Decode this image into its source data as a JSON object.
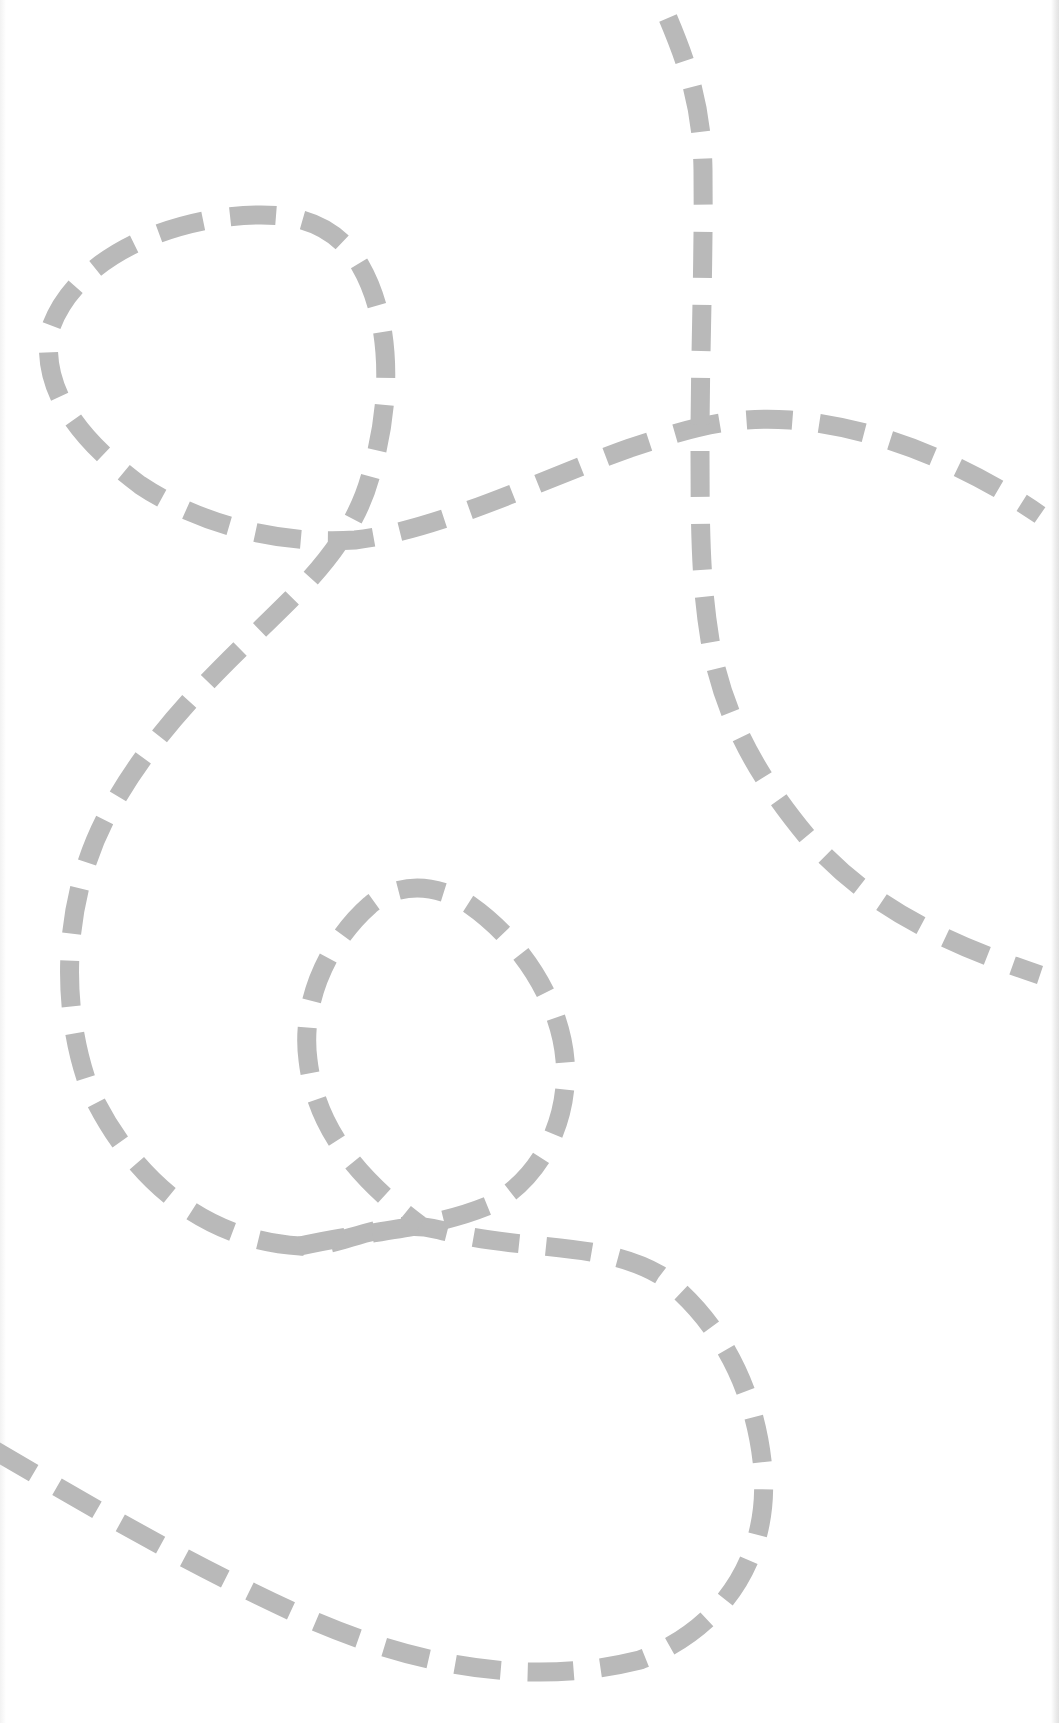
{
  "worksheet": {
    "title": "",
    "description": "Dashed-line tracing / cutting practice sheet",
    "background_color": "#ffffff",
    "line_color": "#b9b9b9",
    "line_width": 19,
    "dash_length": 46,
    "gap_length": 27
  },
  "paths": [
    {
      "name": "winding-loop-path",
      "d": "M -6 1450 C 80 1500, 180 1560, 300 1615 C 400 1660, 520 1690, 640 1660 C 720 1630, 770 1560, 763 1470 C 756 1390, 720 1320, 660 1275 C 600 1240, 520 1252, 440 1230 C 380 1215, 340 1250, 300 1246 C 200 1240, 130 1175, 90 1090 C 60 1010, 60 900, 110 810 C 160 720, 230 660, 290 600 C 330 560, 360 520, 372 470 C 392 400, 392 320, 360 265 C 330 215, 280 210, 220 218 C 140 230, 70 270, 50 330 C 40 390, 80 440, 140 485 C 200 525, 280 545, 355 540 C 440 530, 540 480, 630 448 C 690 428, 730 416, 790 420 C 870 426, 960 460, 1040 515"
    },
    {
      "name": "lower-small-loop-path",
      "d": "M 300 1246 C 370 1230, 430 1230, 490 1205 C 540 1180, 570 1120, 565 1060 C 560 1000, 520 940, 470 905 C 440 885, 400 880, 370 905 C 330 940, 300 1000, 308 1060 C 316 1130, 360 1180, 420 1225"
    },
    {
      "name": "vertical-curve-path",
      "d": "M 668 18 C 690 70, 702 110, 703 170 C 704 260, 700 360, 700 440 C 700 520, 700 580, 710 640 C 724 720, 760 780, 810 840 C 860 895, 920 935, 1040 975"
    }
  ]
}
